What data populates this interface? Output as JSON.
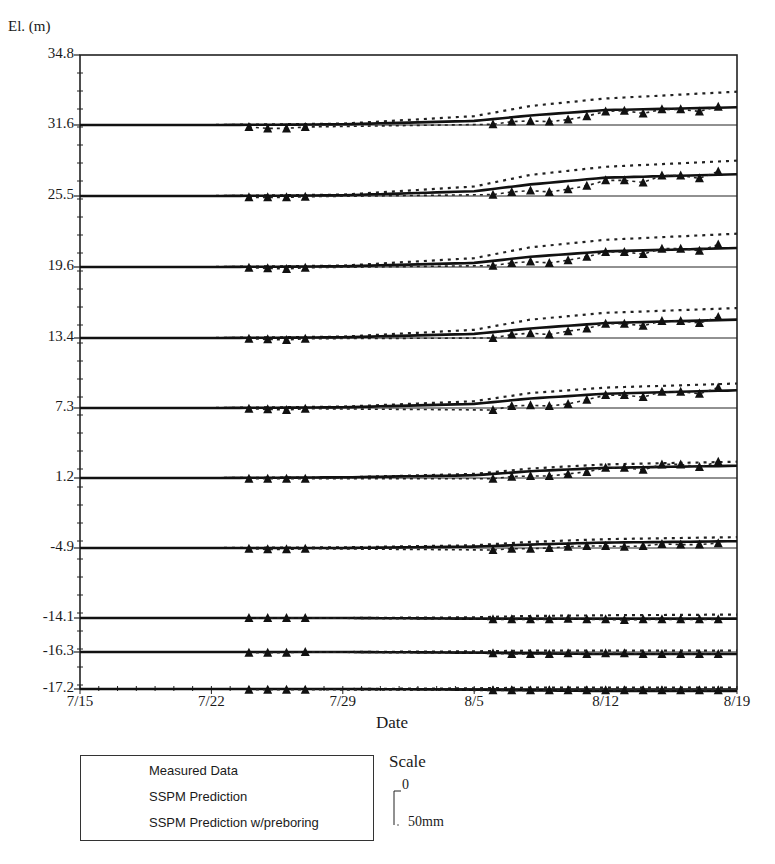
{
  "figure": {
    "y_axis_title": "El. (m)",
    "x_axis_title": "Date",
    "caption": "Figure"
  },
  "chart_data": {
    "type": "line",
    "title": "",
    "xlabel": "Date",
    "ylabel": "El. (m)",
    "x_ticks": [
      "7/15",
      "7/22",
      "7/29",
      "8/5",
      "8/12",
      "8/19"
    ],
    "x_range_days": [
      0,
      35
    ],
    "y_tick_labels": [
      "34.8",
      "31.6",
      "25.5",
      "19.6",
      "13.4",
      "7.3",
      "1.2",
      "-4.9",
      "-14.1",
      "-16.3",
      "-17.2"
    ],
    "units_note": "Each elevation baseline shows vertical displacement offset in mm (positive = heave), vertical scale bar 0 to 50mm",
    "scale": {
      "title": "Scale",
      "top_label": "0",
      "bottom_label": "50mm",
      "mm": 50
    },
    "legend": [
      {
        "name": "Measured Data",
        "style": "dotted-with-triangles"
      },
      {
        "name": "SSPM Prediction",
        "style": "dotted"
      },
      {
        "name": "SSPM Prediction w/preboring",
        "style": "solid-thick"
      }
    ],
    "legend_position": "bottom-left",
    "grid": false,
    "days": [
      0,
      7,
      14,
      21,
      24,
      28,
      35
    ],
    "measured_days": [
      9,
      10,
      11,
      12,
      22,
      23,
      24,
      25,
      26,
      27,
      28,
      29,
      30,
      31,
      32,
      33,
      34
    ],
    "series": [
      {
        "elevation": "31.6",
        "baseline_y": 125,
        "sspm": [
          0,
          0,
          2,
          13,
          28,
          39,
          49
        ],
        "preboring": [
          0,
          0,
          1,
          6,
          14,
          22,
          26
        ],
        "measured": [
          -3,
          -5,
          -5,
          -3,
          1,
          5,
          6,
          5,
          8,
          13,
          20,
          21,
          17,
          23,
          23,
          20,
          27
        ]
      },
      {
        "elevation": "25.5",
        "baseline_y": 196,
        "sspm": [
          0,
          0,
          2,
          14,
          31,
          43,
          52
        ],
        "preboring": [
          0,
          0,
          1,
          7,
          17,
          27,
          32
        ],
        "measured": [
          -2,
          -2,
          -2,
          -1,
          2,
          6,
          8,
          6,
          10,
          15,
          23,
          23,
          20,
          30,
          30,
          26,
          36
        ]
      },
      {
        "elevation": "19.6",
        "baseline_y": 267,
        "sspm": [
          0,
          0,
          2,
          13,
          29,
          40,
          49
        ],
        "preboring": [
          0,
          0,
          1,
          6,
          15,
          23,
          28
        ],
        "measured": [
          -1,
          -2,
          -3,
          -1,
          2,
          6,
          8,
          6,
          10,
          15,
          22,
          22,
          19,
          27,
          27,
          24,
          33
        ]
      },
      {
        "elevation": "13.4",
        "baseline_y": 338,
        "sspm": [
          0,
          0,
          2,
          12,
          27,
          37,
          44
        ],
        "preboring": [
          0,
          0,
          1,
          6,
          14,
          22,
          27
        ],
        "measured": [
          -1,
          -2,
          -3,
          -1,
          0,
          5,
          7,
          5,
          10,
          14,
          21,
          21,
          18,
          25,
          25,
          22,
          31
        ]
      },
      {
        "elevation": "7.3",
        "baseline_y": 408,
        "sspm": [
          0,
          0,
          2,
          10,
          22,
          30,
          36
        ],
        "preboring": [
          0,
          0,
          1,
          6,
          14,
          21,
          26
        ],
        "measured": [
          -1,
          -2,
          -3,
          -1,
          -3,
          3,
          4,
          3,
          6,
          12,
          19,
          19,
          16,
          24,
          24,
          21,
          30
        ]
      },
      {
        "elevation": "1.2",
        "baseline_y": 478,
        "sspm": [
          0,
          0,
          1,
          6,
          14,
          20,
          24
        ],
        "preboring": [
          0,
          0,
          1,
          4,
          10,
          15,
          18
        ],
        "measured": [
          -1,
          -1,
          -1,
          -1,
          -1,
          2,
          3,
          3,
          6,
          9,
          15,
          15,
          12,
          20,
          20,
          16,
          24
        ]
      },
      {
        "elevation": "-4.9",
        "baseline_y": 548,
        "sspm": [
          0,
          0,
          1,
          4,
          9,
          13,
          16
        ],
        "preboring": [
          0,
          0,
          0,
          2,
          5,
          8,
          10
        ],
        "measured": [
          -1,
          -2,
          -2,
          -1,
          -3,
          -1,
          -1,
          0,
          2,
          3,
          3,
          2,
          3,
          6,
          5,
          5,
          7
        ]
      },
      {
        "elevation": "-14.1",
        "baseline_y": 618,
        "sspm": [
          0,
          0,
          0,
          1,
          3,
          4,
          5
        ],
        "preboring": [
          0,
          0,
          0,
          -1,
          -1,
          -1,
          -1
        ],
        "measured": [
          0,
          0,
          0,
          0,
          -2,
          -2,
          -2,
          -2,
          -1,
          -2,
          -2,
          -3,
          -2,
          -2,
          -2,
          -2,
          -2
        ]
      },
      {
        "elevation": "-16.3",
        "baseline_y": 652,
        "sspm": [
          0,
          0,
          0,
          1,
          2,
          2,
          2
        ],
        "preboring": [
          0,
          0,
          0,
          -1,
          -2,
          -3,
          -3
        ],
        "measured": [
          -1,
          -1,
          -1,
          0,
          -2,
          -3,
          -3,
          -3,
          -2,
          -3,
          -2,
          -2,
          -3,
          -3,
          -3,
          -3,
          -3
        ]
      },
      {
        "elevation": "-17.2",
        "baseline_y": 689,
        "sspm": [
          0,
          0,
          0,
          1,
          2,
          2,
          2
        ],
        "preboring": [
          0,
          0,
          0,
          -1,
          -2,
          -3,
          -3
        ],
        "measured": [
          -1,
          -1,
          -1,
          -1,
          -2,
          -2,
          -2,
          -2,
          -2,
          -2,
          -2,
          -2,
          -2,
          -2,
          -2,
          -2,
          -2
        ]
      }
    ]
  }
}
